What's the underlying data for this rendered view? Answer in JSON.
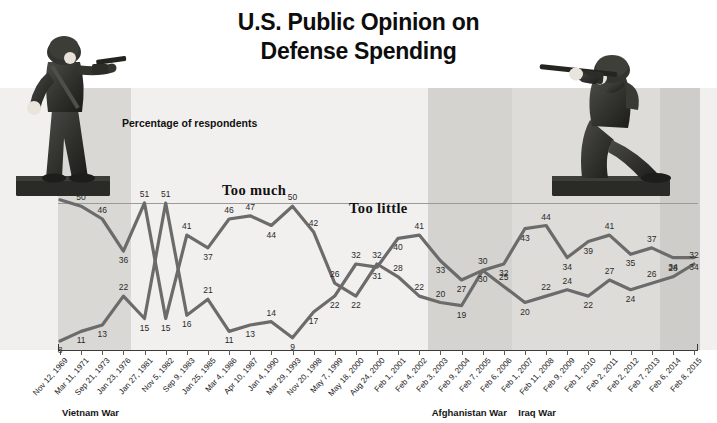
{
  "title_line1": "U.S. Public Opinion on",
  "title_line2": "Defense Spending",
  "caption": "Percentage of respondents",
  "bands": [
    {
      "name": "vietnam",
      "label": "Vietnam War"
    },
    {
      "name": "afghanistan",
      "label": "Afghanistan War"
    },
    {
      "name": "iraq",
      "label": "Iraq War"
    }
  ],
  "colors": {
    "line": "#6b6b6b",
    "plot_background": "#f1f0ee",
    "band_shade": "#d9d8d4",
    "axis": "#3a3a3a",
    "text": "#111111"
  },
  "chart_data": {
    "type": "line",
    "title": "U.S. Public Opinion on Defense Spending",
    "subtitle": "Percentage of respondents",
    "xlabel": "",
    "ylabel": "Percentage of respondents",
    "ylim": [
      0,
      55
    ],
    "grid": false,
    "legend_position": "inline-labels",
    "annotations": [
      "Too much",
      "Too little",
      "Vietnam War",
      "Afghanistan War",
      "Iraq War"
    ],
    "categories": [
      "Nov 12, 1969",
      "Mar 11, 1971",
      "Sep 21, 1973",
      "Jan 23, 1976",
      "Jan 27, 1981",
      "Nov 5, 1982",
      "Sep 9, 1983",
      "Jan 25, 1985",
      "Mar 4, 1986",
      "Apr 10, 1987",
      "Jan 4, 1990",
      "Mar 29, 1993",
      "Nov 20, 1998",
      "May 7, 1999",
      "May 18, 2000",
      "Aug 24, 2000",
      "Feb 1, 2001",
      "Feb 4, 2002",
      "Feb 3, 2003",
      "Feb 9, 2004",
      "Feb 7, 2005",
      "Feb 6, 2006",
      "Feb 1, 2007",
      "Feb 11, 2008",
      "Feb 9, 2009",
      "Feb 1, 2010",
      "Feb 2, 2011",
      "Feb 2, 2012",
      "Feb 7, 2013",
      "Feb 6, 2014",
      "Feb 8, 2015"
    ],
    "series": [
      {
        "name": "Too much",
        "values": [
          52,
          50,
          46,
          36,
          51,
          15,
          41,
          37,
          46,
          47,
          44,
          50,
          42,
          26,
          22,
          32,
          28,
          22,
          20,
          19,
          30,
          25,
          20,
          22,
          24,
          22,
          27,
          24,
          26,
          28,
          32
        ]
      },
      {
        "name": "Too little",
        "values": [
          8,
          11,
          13,
          22,
          15,
          51,
          16,
          21,
          11,
          13,
          14,
          9,
          17,
          22,
          32,
          31,
          40,
          41,
          33,
          27,
          30,
          32,
          43,
          44,
          34,
          39,
          41,
          35,
          37,
          34,
          34
        ]
      }
    ],
    "point_labels_too_much": [
      {
        "x": "Nov 12, 1969",
        "v": 52
      },
      {
        "x": "Mar 11, 1971",
        "v": 50
      },
      {
        "x": "Sep 21, 1973",
        "v": 46
      },
      {
        "x": "Jan 23, 1976",
        "v": 36
      },
      {
        "x": "Jan 27, 1981",
        "v": 51
      },
      {
        "x": "Nov 5, 1982",
        "v": 15
      },
      {
        "x": "Sep 9, 1983",
        "v": 41
      },
      {
        "x": "Jan 25, 1985",
        "v": 37
      },
      {
        "x": "Mar 4, 1986",
        "v": 46
      },
      {
        "x": "Apr 10, 1987",
        "v": 47
      },
      {
        "x": "Jan 4, 1990",
        "v": 44
      },
      {
        "x": "Mar 29, 1993",
        "v": 50
      },
      {
        "x": "Nov 20, 1998",
        "v": 42
      },
      {
        "x": "May 7, 1999",
        "v": 26
      },
      {
        "x": "May 18, 2000",
        "v": 22
      },
      {
        "x": "Aug 24, 2000",
        "v": 32
      },
      {
        "x": "Feb 1, 2001",
        "v": 28
      },
      {
        "x": "Feb 4, 2002",
        "v": 22
      },
      {
        "x": "Feb 3, 2003",
        "v": 20
      },
      {
        "x": "Feb 9, 2004",
        "v": 19
      },
      {
        "x": "Feb 7, 2005",
        "v": 30
      },
      {
        "x": "Feb 6, 2006",
        "v": 25
      },
      {
        "x": "Feb 1, 2007",
        "v": 20
      },
      {
        "x": "Feb 11, 2008",
        "v": 22
      },
      {
        "x": "Feb 9, 2009",
        "v": 24
      },
      {
        "x": "Feb 1, 2010",
        "v": 22
      },
      {
        "x": "Feb 2, 2011",
        "v": 27
      },
      {
        "x": "Feb 2, 2012",
        "v": 24
      },
      {
        "x": "Feb 7, 2013",
        "v": 26
      },
      {
        "x": "Feb 6, 2014",
        "v": 28
      },
      {
        "x": "Feb 8, 2015",
        "v": 32
      }
    ],
    "point_labels_too_little": [
      {
        "x": "Nov 12, 1969",
        "v": 8
      },
      {
        "x": "Mar 11, 1971",
        "v": 11
      },
      {
        "x": "Sep 21, 1973",
        "v": 13
      },
      {
        "x": "Jan 23, 1976",
        "v": 22
      },
      {
        "x": "Jan 27, 1981",
        "v": 15
      },
      {
        "x": "Nov 5, 1982",
        "v": 51
      },
      {
        "x": "Sep 9, 1983",
        "v": 16
      },
      {
        "x": "Jan 25, 1985",
        "v": 21
      },
      {
        "x": "Mar 4, 1986",
        "v": 11
      },
      {
        "x": "Apr 10, 1987",
        "v": 13
      },
      {
        "x": "Jan 4, 1990",
        "v": 14
      },
      {
        "x": "Mar 29, 1993",
        "v": 9
      },
      {
        "x": "Nov 20, 1998",
        "v": 17
      },
      {
        "x": "May 7, 1999",
        "v": 22
      },
      {
        "x": "May 18, 2000",
        "v": 32
      },
      {
        "x": "Aug 24, 2000",
        "v": 31
      },
      {
        "x": "Feb 1, 2001",
        "v": 40
      },
      {
        "x": "Feb 4, 2002",
        "v": 41
      },
      {
        "x": "Feb 3, 2003",
        "v": 33
      },
      {
        "x": "Feb 9, 2004",
        "v": 27
      },
      {
        "x": "Feb 7, 2005",
        "v": 30
      },
      {
        "x": "Feb 6, 2006",
        "v": 32
      },
      {
        "x": "Feb 1, 2007",
        "v": 43
      },
      {
        "x": "Feb 11, 2008",
        "v": 44
      },
      {
        "x": "Feb 9, 2009",
        "v": 34
      },
      {
        "x": "Feb 1, 2010",
        "v": 39
      },
      {
        "x": "Feb 2, 2011",
        "v": 41
      },
      {
        "x": "Feb 2, 2012",
        "v": 35
      },
      {
        "x": "Feb 7, 2013",
        "v": 37
      },
      {
        "x": "Feb 6, 2014",
        "v": 34
      },
      {
        "x": "Feb 8, 2015",
        "v": 34
      }
    ],
    "series_labels": {
      "too_much": "Too much",
      "too_little": "Too little"
    }
  }
}
